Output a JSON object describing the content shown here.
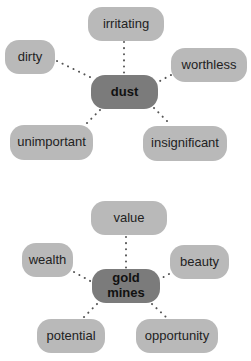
{
  "diagrams": [
    {
      "center": "dust",
      "associations": [
        "irritating",
        "dirty",
        "worthless",
        "unimportant",
        "insignificant"
      ]
    },
    {
      "center": "gold mines",
      "associations": [
        "value",
        "wealth",
        "beauty",
        "potential",
        "opportunity"
      ]
    }
  ],
  "colors": {
    "center_fill": "#7b7b7b",
    "leaf_fill": "#b9b9b9",
    "connector": "#555555"
  }
}
